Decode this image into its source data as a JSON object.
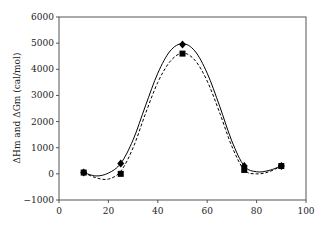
{
  "chart_data": {
    "type": "line",
    "title": "",
    "xlabel": "",
    "ylabel": "ΔHm and ΔGm (cal/mol)",
    "xlim": [
      0,
      100
    ],
    "ylim": [
      -1000,
      6000
    ],
    "x_ticks": [
      0,
      20,
      40,
      60,
      80,
      100
    ],
    "y_ticks": [
      -1000,
      0,
      1000,
      2000,
      3000,
      4000,
      5000,
      6000
    ],
    "x_tick_labels": [
      "0",
      "20",
      "40",
      "60",
      "80",
      "100"
    ],
    "y_tick_labels": [
      "−1000",
      "0",
      "1000",
      "2000",
      "3000",
      "4000",
      "5000",
      "6000"
    ],
    "grid": false,
    "legend": null,
    "series": [
      {
        "name": "ΔHm",
        "marker": "diamond",
        "line_style": "solid",
        "color": "#000000",
        "x": [
          10,
          25,
          50,
          75,
          90
        ],
        "values": [
          50,
          400,
          4950,
          300,
          300
        ],
        "curve": [
          [
            10,
            50
          ],
          [
            15,
            -80
          ],
          [
            20,
            30
          ],
          [
            25,
            400
          ],
          [
            30,
            1300
          ],
          [
            35,
            2600
          ],
          [
            40,
            3850
          ],
          [
            45,
            4700
          ],
          [
            50,
            4980
          ],
          [
            55,
            4700
          ],
          [
            60,
            3850
          ],
          [
            65,
            2600
          ],
          [
            70,
            1250
          ],
          [
            75,
            300
          ],
          [
            80,
            80
          ],
          [
            85,
            130
          ],
          [
            90,
            300
          ]
        ]
      },
      {
        "name": "ΔGm",
        "marker": "square",
        "line_style": "dashed",
        "color": "#000000",
        "x": [
          10,
          25,
          50,
          75,
          90
        ],
        "values": [
          50,
          0,
          4600,
          150,
          300
        ],
        "curve": [
          [
            10,
            50
          ],
          [
            15,
            -150
          ],
          [
            20,
            -200
          ],
          [
            25,
            100
          ],
          [
            30,
            1000
          ],
          [
            35,
            2300
          ],
          [
            40,
            3500
          ],
          [
            45,
            4300
          ],
          [
            50,
            4620
          ],
          [
            55,
            4350
          ],
          [
            60,
            3550
          ],
          [
            65,
            2350
          ],
          [
            70,
            1050
          ],
          [
            75,
            150
          ],
          [
            80,
            0
          ],
          [
            85,
            80
          ],
          [
            90,
            300
          ]
        ]
      }
    ]
  }
}
